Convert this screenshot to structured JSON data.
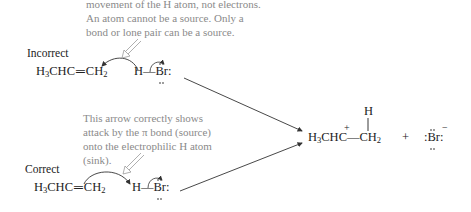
{
  "notes": {
    "incorrect_note_lines": [
      "movement of the H atom, not electrons.",
      "An atom cannot be a source. Only a",
      "bond or lone pair can be a source."
    ],
    "correct_note_lines": [
      "This arrow correctly shows",
      "attack by the π bond (source)",
      "onto the electrophilic H atom",
      "(sink)."
    ]
  },
  "labels": {
    "incorrect": "Incorrect",
    "correct": "Correct"
  },
  "reactants": {
    "alkene": {
      "h3": "H",
      "sub3": "3",
      "chc": "CHC",
      "bond": "═",
      "ch": "CH",
      "sub2": "2"
    },
    "hbr": {
      "h": "H",
      "bond": "—",
      "br": "Br",
      "colon": ":"
    }
  },
  "product": {
    "top_h": "H",
    "cation": {
      "h3": "H",
      "sub3": "3",
      "chc": "CHC",
      "charge": "+",
      "bond": "—",
      "ch": "CH",
      "sub2": "2"
    },
    "plus": "+",
    "bromide": {
      "br": ":Br:",
      "charge": "−"
    }
  },
  "colors": {
    "note_text": "#8a8a8a",
    "chem_text": "#222222",
    "arrow": "#333333",
    "hollow_arrow": "#9a9a9a"
  }
}
